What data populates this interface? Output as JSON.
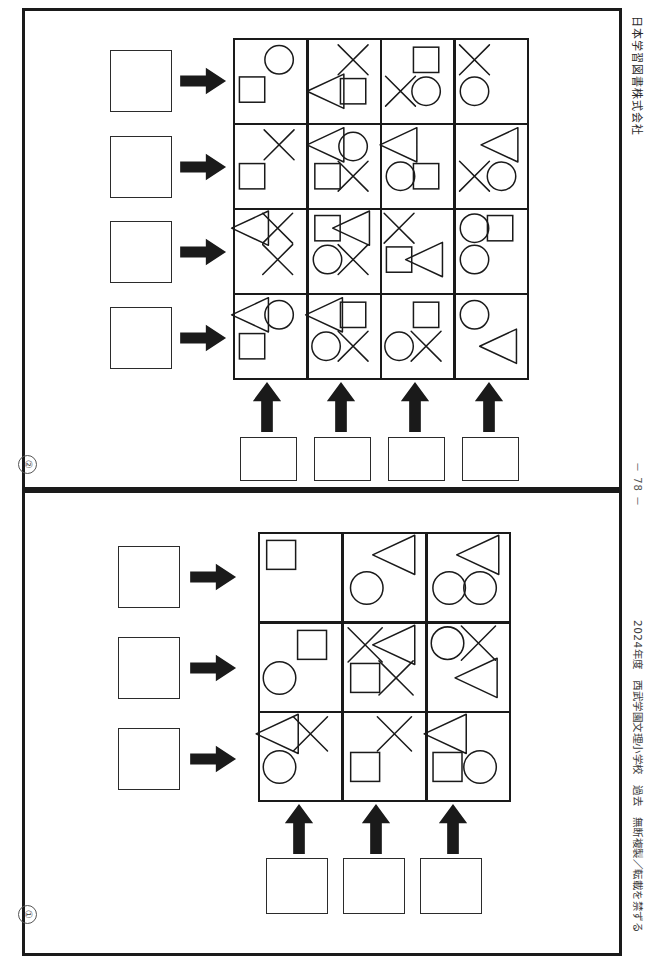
{
  "meta": {
    "publisher": "日本学習図書株式会社",
    "page_number": "－ 78 －",
    "footer_credit": "2024年度　西武学園文理小学校　過去　無断複製／転載を禁ずる",
    "masthead": "問題",
    "ink": "#1a1a1a",
    "paper": "#ffffff"
  },
  "sections": [
    {
      "id": "section-2",
      "number_label": "②",
      "rows": 4,
      "cols": 4,
      "row_answer_boxes": 4,
      "col_answer_boxes": 4,
      "grid": [
        [
          {
            "shapes": [
              {
                "type": "circle",
                "x": 62,
                "y": 24
              },
              {
                "type": "square",
                "x": 24,
                "y": 60
              }
            ]
          },
          {
            "shapes": [
              {
                "type": "cross",
                "x": 62,
                "y": 24
              },
              {
                "type": "triangle",
                "x": 26,
                "y": 62
              },
              {
                "type": "square",
                "x": 62,
                "y": 62
              }
            ]
          },
          {
            "shapes": [
              {
                "type": "square",
                "x": 62,
                "y": 24
              },
              {
                "type": "cross",
                "x": 26,
                "y": 62
              },
              {
                "type": "circle",
                "x": 62,
                "y": 62
              }
            ]
          },
          {
            "shapes": [
              {
                "type": "cross",
                "x": 26,
                "y": 24
              },
              {
                "type": "circle",
                "x": 26,
                "y": 62
              }
            ]
          }
        ],
        [
          {
            "shapes": [
              {
                "type": "cross",
                "x": 62,
                "y": 24
              },
              {
                "type": "square",
                "x": 24,
                "y": 62
              }
            ]
          },
          {
            "shapes": [
              {
                "type": "triangle",
                "x": 26,
                "y": 24
              },
              {
                "type": "circle",
                "x": 62,
                "y": 26
              },
              {
                "type": "square",
                "x": 26,
                "y": 62
              },
              {
                "type": "cross",
                "x": 62,
                "y": 62
              }
            ]
          },
          {
            "shapes": [
              {
                "type": "triangle",
                "x": 26,
                "y": 24
              },
              {
                "type": "circle",
                "x": 26,
                "y": 62
              },
              {
                "type": "square",
                "x": 62,
                "y": 62
              }
            ]
          },
          {
            "shapes": [
              {
                "type": "triangle",
                "x": 64,
                "y": 24
              },
              {
                "type": "cross",
                "x": 26,
                "y": 62
              },
              {
                "type": "circle",
                "x": 64,
                "y": 62
              }
            ]
          }
        ],
        [
          {
            "shapes": [
              {
                "type": "triangle",
                "x": 24,
                "y": 22
              },
              {
                "type": "cross",
                "x": 60,
                "y": 22
              },
              {
                "type": "cross",
                "x": 60,
                "y": 60
              }
            ]
          },
          {
            "shapes": [
              {
                "type": "square",
                "x": 26,
                "y": 22
              },
              {
                "type": "triangle",
                "x": 62,
                "y": 22
              },
              {
                "type": "circle",
                "x": 26,
                "y": 60
              },
              {
                "type": "cross",
                "x": 62,
                "y": 60
              }
            ]
          },
          {
            "shapes": [
              {
                "type": "cross",
                "x": 24,
                "y": 22
              },
              {
                "type": "square",
                "x": 24,
                "y": 60
              },
              {
                "type": "triangle",
                "x": 62,
                "y": 60
              }
            ]
          },
          {
            "shapes": [
              {
                "type": "circle",
                "x": 26,
                "y": 22
              },
              {
                "type": "square",
                "x": 62,
                "y": 22
              },
              {
                "type": "circle",
                "x": 26,
                "y": 60
              }
            ]
          }
        ],
        [
          {
            "shapes": [
              {
                "type": "triangle",
                "x": 24,
                "y": 24
              },
              {
                "type": "circle",
                "x": 62,
                "y": 24
              },
              {
                "type": "square",
                "x": 24,
                "y": 62
              }
            ]
          },
          {
            "shapes": [
              {
                "type": "triangle",
                "x": 24,
                "y": 24
              },
              {
                "type": "square",
                "x": 62,
                "y": 24
              },
              {
                "type": "circle",
                "x": 24,
                "y": 62
              },
              {
                "type": "cross",
                "x": 62,
                "y": 62
              }
            ]
          },
          {
            "shapes": [
              {
                "type": "square",
                "x": 62,
                "y": 24
              },
              {
                "type": "circle",
                "x": 24,
                "y": 62
              },
              {
                "type": "cross",
                "x": 62,
                "y": 62
              }
            ]
          },
          {
            "shapes": [
              {
                "type": "circle",
                "x": 26,
                "y": 24
              },
              {
                "type": "triangle",
                "x": 62,
                "y": 62
              }
            ]
          }
        ]
      ]
    },
    {
      "id": "section-1",
      "number_label": "①",
      "rows": 3,
      "cols": 3,
      "row_answer_boxes": 3,
      "col_answer_boxes": 3,
      "grid": [
        [
          {
            "shapes": [
              {
                "type": "square",
                "x": 26,
                "y": 24
              }
            ]
          },
          {
            "shapes": [
              {
                "type": "triangle",
                "x": 64,
                "y": 24
              },
              {
                "type": "circle",
                "x": 28,
                "y": 62
              }
            ]
          },
          {
            "shapes": [
              {
                "type": "triangle",
                "x": 64,
                "y": 24
              },
              {
                "type": "circle",
                "x": 26,
                "y": 62
              },
              {
                "type": "circle",
                "x": 64,
                "y": 62
              }
            ]
          }
        ],
        [
          {
            "shapes": [
              {
                "type": "square",
                "x": 64,
                "y": 24
              },
              {
                "type": "circle",
                "x": 24,
                "y": 62
              }
            ]
          },
          {
            "shapes": [
              {
                "type": "cross",
                "x": 26,
                "y": 24
              },
              {
                "type": "triangle",
                "x": 64,
                "y": 24
              },
              {
                "type": "square",
                "x": 26,
                "y": 62
              },
              {
                "type": "cross",
                "x": 64,
                "y": 62
              }
            ]
          },
          {
            "shapes": [
              {
                "type": "circle",
                "x": 24,
                "y": 22
              },
              {
                "type": "cross",
                "x": 62,
                "y": 22
              },
              {
                "type": "triangle",
                "x": 62,
                "y": 62
              }
            ]
          }
        ],
        [
          {
            "shapes": [
              {
                "type": "triangle",
                "x": 24,
                "y": 24
              },
              {
                "type": "cross",
                "x": 62,
                "y": 24
              },
              {
                "type": "circle",
                "x": 24,
                "y": 62
              }
            ]
          },
          {
            "shapes": [
              {
                "type": "cross",
                "x": 62,
                "y": 24
              },
              {
                "type": "square",
                "x": 26,
                "y": 62
              }
            ]
          },
          {
            "shapes": [
              {
                "type": "triangle",
                "x": 24,
                "y": 24
              },
              {
                "type": "square",
                "x": 24,
                "y": 62
              },
              {
                "type": "circle",
                "x": 64,
                "y": 62
              }
            ]
          }
        ]
      ]
    }
  ],
  "icons": {
    "right_arrow": "right-arrow-icon",
    "up_arrow": "up-arrow-icon",
    "answer_box": "answer-box"
  }
}
